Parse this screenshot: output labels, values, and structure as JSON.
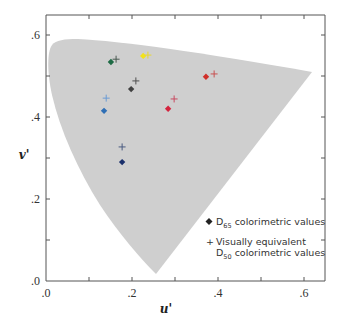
{
  "chart_data": {
    "type": "scatter",
    "title": "",
    "xlabel": "u'",
    "ylabel": "v'",
    "xlim": [
      0.0,
      0.65
    ],
    "ylim": [
      0.0,
      0.65
    ],
    "x_ticks": [
      ".0",
      ".2",
      ".4",
      ".6"
    ],
    "y_ticks": [
      ".0",
      ".2",
      ".4",
      ".6"
    ],
    "x_tick_values": [
      0.0,
      0.2,
      0.4,
      0.6
    ],
    "y_tick_values": [
      0.0,
      0.2,
      0.4,
      0.6
    ],
    "grid": false,
    "background_region": "spectral locus (chromaticity gamut) shaded light gray",
    "legend": {
      "position": "lower right",
      "entries": [
        {
          "marker": "diamond",
          "symbol": "◆",
          "label_main": "D",
          "label_sub": "65",
          "label_rest": " colorimetric values"
        },
        {
          "marker": "plus",
          "symbol": "+",
          "label_line1": "Visually equivalent",
          "label_main": "D",
          "label_sub": "50",
          "label_rest": " colorimetric values"
        }
      ]
    },
    "series": [
      {
        "name": "D65 colorimetric values",
        "marker": "diamond",
        "points": [
          {
            "color_name": "green",
            "color": "#1e6b45",
            "u": 0.151,
            "v": 0.534
          },
          {
            "color_name": "yellow",
            "color": "#f2e21c",
            "u": 0.226,
            "v": 0.549
          },
          {
            "color_name": "gray",
            "color": "#404040",
            "u": 0.198,
            "v": 0.468
          },
          {
            "color_name": "light-blue",
            "color": "#2f6fb5",
            "u": 0.135,
            "v": 0.415
          },
          {
            "color_name": "navy",
            "color": "#1a2f6b",
            "u": 0.177,
            "v": 0.29
          },
          {
            "color_name": "crimson",
            "color": "#d4243e",
            "u": 0.284,
            "v": 0.42
          },
          {
            "color_name": "red",
            "color": "#d0302a",
            "u": 0.372,
            "v": 0.498
          }
        ]
      },
      {
        "name": "Visually equivalent D50 colorimetric values",
        "marker": "plus",
        "points": [
          {
            "color_name": "green",
            "color": "#4a5a52",
            "u": 0.163,
            "v": 0.541
          },
          {
            "color_name": "yellow",
            "color": "#e8d830",
            "u": 0.237,
            "v": 0.551
          },
          {
            "color_name": "gray",
            "color": "#505050",
            "u": 0.209,
            "v": 0.488
          },
          {
            "color_name": "light-blue",
            "color": "#6b9bd4",
            "u": 0.14,
            "v": 0.446
          },
          {
            "color_name": "navy",
            "color": "#4a5a80",
            "u": 0.177,
            "v": 0.327
          },
          {
            "color_name": "crimson",
            "color": "#c84a60",
            "u": 0.298,
            "v": 0.444
          },
          {
            "color_name": "red",
            "color": "#c85050",
            "u": 0.391,
            "v": 0.505
          }
        ]
      }
    ]
  },
  "colors": {
    "gamut_fill": "#cfcfcf",
    "axis": "#555555",
    "text": "#333333"
  }
}
